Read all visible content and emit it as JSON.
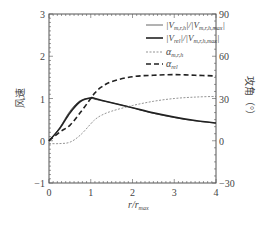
{
  "chart_data": {
    "type": "line",
    "title": "",
    "xlabel": "r/r_max",
    "ylabel": "风速",
    "ylabel_right": "攻角（°）",
    "xlim": [
      0,
      4
    ],
    "ylim": [
      -1,
      3
    ],
    "ylim_right": [
      -30,
      90
    ],
    "xticks": [
      "0",
      "1",
      "2",
      "3",
      "4"
    ],
    "yticks": [
      "-1",
      "0",
      "1",
      "2",
      "3"
    ],
    "yticks_right": [
      "-30",
      "0",
      "30",
      "60",
      "90"
    ],
    "grid": false,
    "legend_position": "upper right",
    "x": [
      0,
      0.25,
      0.5,
      0.75,
      1.0,
      1.1,
      1.25,
      1.5,
      2.0,
      2.5,
      3.0,
      3.5,
      4.0
    ],
    "series": [
      {
        "name": "|V_m,r,h|/|V_m,r,h,max|",
        "axis": "left",
        "style": "solid-thin",
        "values": [
          0.0,
          0.3,
          0.7,
          0.95,
          1.0,
          0.98,
          0.95,
          0.9,
          0.78,
          0.65,
          0.55,
          0.47,
          0.42
        ]
      },
      {
        "name": "|V_rel|/|V_m,r,h,max|",
        "axis": "left",
        "style": "solid-thick",
        "values": [
          0.0,
          0.28,
          0.66,
          0.93,
          1.02,
          1.0,
          0.96,
          0.9,
          0.78,
          0.66,
          0.56,
          0.48,
          0.42
        ]
      },
      {
        "name": "α_m,r,h",
        "axis": "right",
        "style": "dotted-thin",
        "values": [
          -2.0,
          -2.0,
          -1.0,
          4.0,
          12.0,
          15.0,
          18.0,
          21.0,
          25.0,
          28.0,
          30.0,
          31.0,
          31.5
        ]
      },
      {
        "name": "α_rel",
        "axis": "right",
        "style": "dashed-thick",
        "values": [
          0.0,
          6.0,
          11.0,
          20.0,
          30.0,
          34.0,
          38.0,
          42.0,
          45.5,
          46.5,
          47.0,
          46.5,
          46.0
        ]
      }
    ]
  },
  "legend": {
    "items": [
      {
        "label_main": "|V",
        "sub1": "m,r,h",
        "mid": "|/|V",
        "sub2": "m,r,h,max",
        "end": "|"
      },
      {
        "label_main": "|V",
        "sub1": "rel",
        "mid": "|/|V",
        "sub2": "m,r,h,max",
        "end": "|"
      },
      {
        "label_main": "α",
        "sub1": "m,r,h",
        "mid": "",
        "sub2": "",
        "end": ""
      },
      {
        "label_main": "α",
        "sub1": "rel",
        "mid": "",
        "sub2": "",
        "end": ""
      }
    ]
  },
  "axes": {
    "xlabel_main": "r/r",
    "xlabel_sub": "max",
    "ylabel_left": "风速",
    "ylabel_right": "攻角（°）"
  }
}
